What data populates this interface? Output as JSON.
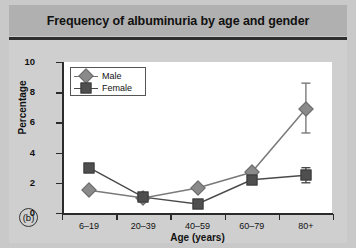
{
  "title": "Frequency of albuminuria by age and gender",
  "panel_label": "(b)",
  "legend": {
    "male_label": "Male",
    "female_label": "Female"
  },
  "axis": {
    "y_title": "Percentage",
    "x_title": "Age (years)",
    "y_ticks": [
      "0",
      "2",
      "4",
      "6",
      "8",
      "10"
    ],
    "x_ticks": [
      "6–19",
      "20–39",
      "40–59",
      "60–79",
      "80+"
    ]
  },
  "colors": {
    "title_band": "#b0b0b0",
    "page_background": "#cfcfcf",
    "plot_background": "#ffffff",
    "male_marker": "#8a8a8a",
    "female_marker": "#4f4f4f",
    "axis": "#2b2b2b"
  },
  "chart_data": {
    "type": "line",
    "title": "Frequency of albuminuria by age and gender",
    "xlabel": "Age (years)",
    "ylabel": "Percentage",
    "categories": [
      "6–19",
      "20–39",
      "40–59",
      "60–79",
      "80+"
    ],
    "ylim": [
      0,
      10
    ],
    "yticks": [
      0,
      2,
      4,
      6,
      8,
      10
    ],
    "grid": false,
    "legend_position": "top-left inside plot",
    "series": [
      {
        "name": "Male",
        "marker": "diamond",
        "color": "#8a8a8a",
        "values": [
          1.5,
          1.0,
          1.65,
          2.7,
          6.9
        ],
        "error_upper": [
          null,
          null,
          null,
          null,
          8.6
        ],
        "error_lower": [
          null,
          null,
          null,
          null,
          5.3
        ]
      },
      {
        "name": "Female",
        "marker": "square",
        "color": "#4f4f4f",
        "values": [
          3.0,
          1.05,
          0.6,
          2.2,
          2.5
        ],
        "error_upper": [
          null,
          null,
          null,
          null,
          3.0
        ],
        "error_lower": [
          null,
          null,
          null,
          null,
          2.0
        ]
      }
    ]
  }
}
